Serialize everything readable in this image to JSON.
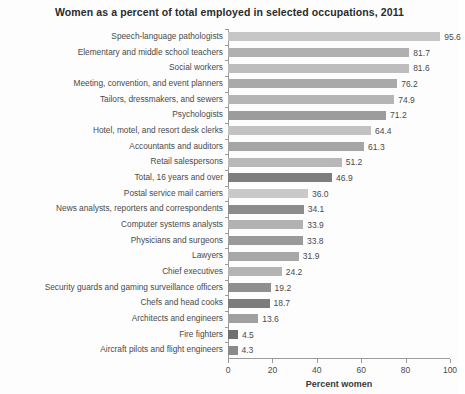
{
  "chart_data": {
    "type": "bar",
    "orientation": "horizontal",
    "title": "Women as a percent of total employed in selected occupations, 2011",
    "xlabel": "Percent women",
    "ylabel": "",
    "xlim": [
      0,
      100
    ],
    "xticks": [
      0,
      20,
      40,
      60,
      80,
      100
    ],
    "xtick_labels": [
      "0",
      "20",
      "40",
      "60",
      "80",
      "100"
    ],
    "grid": false,
    "legend": null,
    "categories": [
      "Speech-language pathologists",
      "Elementary and middle school teachers",
      "Social workers",
      "Meeting, convention, and event planners",
      "Tailors, dressmakers, and sewers",
      "Psychologists",
      "Hotel, motel, and resort desk clerks",
      "Accountants and auditors",
      "Retail salespersons",
      "Total, 16 years and over",
      "Postal service mail carriers",
      "News analysts, reporters and correspondents",
      "Computer systems analysts",
      "Physicians and surgeons",
      "Lawyers",
      "Chief executives",
      "Security guards and gaming surveillance officers",
      "Chefs and head cooks",
      "Architects and engineers",
      "Fire fighters",
      "Aircraft pilots and flight engineers"
    ],
    "values": [
      95.6,
      81.7,
      81.6,
      76.2,
      74.9,
      71.2,
      64.4,
      61.3,
      51.2,
      46.9,
      36.0,
      34.1,
      33.9,
      33.8,
      31.9,
      24.2,
      19.2,
      18.7,
      13.6,
      4.5,
      4.3
    ],
    "value_labels": [
      "95.6",
      "81.7",
      "81.6",
      "76.2",
      "74.9",
      "71.2",
      "64.4",
      "61.3",
      "51.2",
      "46.9",
      "36.0",
      "34.1",
      "33.9",
      "33.8",
      "31.9",
      "24.2",
      "19.2",
      "18.7",
      "13.6",
      "4.5",
      "4.3"
    ],
    "bar_colors": [
      "#c6c6c6",
      "#b0b0b0",
      "#bdbdbd",
      "#a9a9a9",
      "#b5b5b5",
      "#9c9c9c",
      "#c2c2c2",
      "#a5a5a5",
      "#b8b8b8",
      "#7e7e7e",
      "#c9c9c9",
      "#8c8c8c",
      "#b2b2b2",
      "#9a9a9a",
      "#a8a8a8",
      "#b4b4b4",
      "#8f8f8f",
      "#7c7c7c",
      "#a0a0a0",
      "#6f6f6f",
      "#8a8a8a"
    ],
    "highlight_category": "Total, 16 years and over"
  },
  "axis": {
    "axis_color": "#9a9a9a"
  }
}
